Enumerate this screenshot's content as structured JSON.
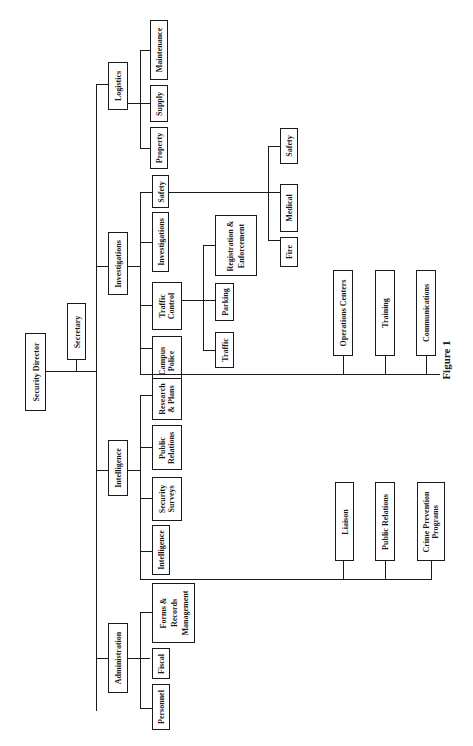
{
  "figure": {
    "caption": "Figure 1",
    "top_cut_text": "· · ·  · · · · ·  · ·"
  },
  "org": {
    "director": "Security Director",
    "secretary": "Secretary",
    "divisions": {
      "logistics": {
        "label": "Logistics",
        "units": [
          "Property",
          "Supply",
          "Maintenance"
        ]
      },
      "investigations": {
        "label": "Investigations",
        "units": {
          "campus_police": "Campus Police",
          "traffic_control": "Traffic Control",
          "investigations": "Investigations",
          "safety": "Safety"
        },
        "traffic_sub": [
          "Traffic",
          "Parking",
          "Registration & Enforcement"
        ],
        "safety_sub": [
          "Fire",
          "Medical",
          "Safety"
        ],
        "support": [
          "Operations Centers",
          "Training",
          "Communications"
        ]
      },
      "intelligence": {
        "label": "Intelligence",
        "units": [
          "Intelligence",
          "Security Surveys",
          "Public Relations",
          "Research & Plans"
        ],
        "support": [
          "Liaison",
          "Public Relations",
          "Crime Prevention Programs"
        ]
      },
      "administration": {
        "label": "Administration",
        "units": [
          "Personnel",
          "Fiscal",
          "Forms & Records Management"
        ]
      }
    }
  }
}
